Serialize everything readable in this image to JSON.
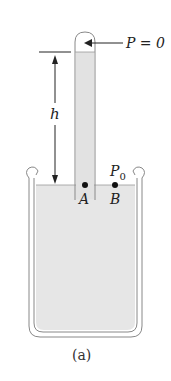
{
  "diagram": {
    "pressure_top_label": "P = 0",
    "height_label": "h",
    "atm_pressure_label": "P",
    "atm_pressure_sub": "0",
    "point_a_label": "A",
    "point_b_label": "B",
    "caption": "(a)"
  },
  "colors": {
    "liquid": "#e4e4e4",
    "stroke": "#777777",
    "text": "#222222"
  }
}
